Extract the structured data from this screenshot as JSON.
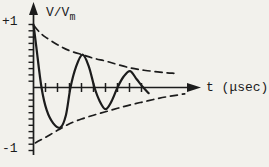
{
  "figure": {
    "y_axis_label_main": "V/V",
    "y_axis_label_sub": "m",
    "x_axis_label": "t (μsec)",
    "y_tick_label_top": "+1",
    "y_tick_label_bottom": "-1"
  },
  "colors": {
    "ink": "#1c1c1c",
    "paper": "#f2f1ec"
  },
  "chart_data": {
    "type": "line",
    "xlabel": "t (μsec)",
    "ylabel": "V/V_m",
    "xlim": [
      0,
      14
    ],
    "ylim": [
      -1.05,
      1.3
    ],
    "grid": false,
    "x_ticks": {
      "start": 1,
      "step": 1,
      "count": 9,
      "labels_shown": []
    },
    "y_ticks": {
      "start": -1.0,
      "step": 0.1,
      "count": 21,
      "labels_shown": [
        "+1",
        "-1"
      ]
    },
    "series": [
      {
        "name": "damped-oscillation",
        "style": "solid",
        "points": [
          [
            0,
            1.0
          ],
          [
            0.25,
            0.62
          ],
          [
            0.67,
            0
          ],
          [
            1.1,
            -0.36
          ],
          [
            1.65,
            -0.57
          ],
          [
            2.25,
            -0.635
          ],
          [
            2.7,
            -0.44
          ],
          [
            3.08,
            0
          ],
          [
            3.55,
            0.33
          ],
          [
            4.08,
            0.52
          ],
          [
            4.6,
            0.34
          ],
          [
            5.08,
            0
          ],
          [
            5.5,
            -0.21
          ],
          [
            6.0,
            -0.345
          ],
          [
            6.5,
            -0.22
          ],
          [
            7.0,
            0
          ],
          [
            7.5,
            0.17
          ],
          [
            8.05,
            0.26
          ],
          [
            8.6,
            0.13
          ],
          [
            9.15,
            0
          ],
          [
            9.6,
            -0.09
          ]
        ]
      },
      {
        "name": "upper-envelope",
        "style": "dashed",
        "points": [
          [
            0.05,
            0.98
          ],
          [
            0.5,
            0.88
          ],
          [
            1,
            0.8
          ],
          [
            2,
            0.68
          ],
          [
            3,
            0.585
          ],
          [
            4.08,
            0.52
          ],
          [
            5,
            0.465
          ],
          [
            6,
            0.42
          ],
          [
            7,
            0.365
          ],
          [
            8.08,
            0.31
          ],
          [
            9,
            0.28
          ],
          [
            10,
            0.255
          ],
          [
            11,
            0.235
          ],
          [
            11.7,
            0.225
          ]
        ]
      },
      {
        "name": "lower-envelope",
        "style": "dashed",
        "points": [
          [
            0.15,
            -0.88
          ],
          [
            1,
            -0.79
          ],
          [
            2,
            -0.68
          ],
          [
            2.25,
            -0.655
          ],
          [
            3,
            -0.575
          ],
          [
            4,
            -0.5
          ],
          [
            5,
            -0.44
          ],
          [
            6,
            -0.385
          ],
          [
            7,
            -0.33
          ],
          [
            8,
            -0.28
          ],
          [
            9,
            -0.235
          ],
          [
            10,
            -0.19
          ],
          [
            11,
            -0.15
          ],
          [
            12,
            -0.12
          ],
          [
            12.6,
            -0.1
          ]
        ]
      }
    ]
  }
}
